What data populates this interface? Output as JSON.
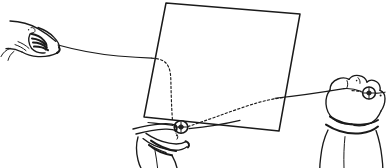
{
  "illustration": {
    "title": "Hand-sewing a button through fabric",
    "medium": "pen-and-ink line drawing",
    "background_color": "#ffffff",
    "ink_color": "#1a1a1a",
    "width": 391,
    "height": 168,
    "caption": "Line drawing: a left hand pulls a thread, the thread passes behind a square of fabric (shown dashed) down to a button held by a hand below, and continues to a second button held by a hand at the right."
  },
  "objects": {
    "fabric": {
      "name": "fabric square",
      "label": "fabric-square",
      "corners": {
        "top_left": [
          166,
          3
        ],
        "top_right": [
          300,
          14
        ],
        "bottom_right": [
          279,
          131
        ],
        "bottom_left": [
          144,
          117
        ]
      },
      "fill": "#ffffff",
      "stroke": "#1a1a1a"
    },
    "hands": [
      {
        "id": "left-hand",
        "label": "left hand pinching thread",
        "position": [
          8,
          18
        ],
        "grip": "pinch",
        "holds": "thread-end"
      },
      {
        "id": "bottom-hand",
        "label": "lower hand holding button",
        "position": [
          132,
          118
        ],
        "grip": "pinch",
        "holds": "button-lower"
      },
      {
        "id": "right-hand",
        "label": "right hand holding button",
        "position": [
          318,
          74
        ],
        "grip": "fist",
        "holds": "button-right",
        "has_cuff": true
      }
    ],
    "buttons": [
      {
        "id": "button-lower",
        "label": "button held below fabric",
        "center": [
          181,
          127
        ],
        "radius": 6.5,
        "hole_radius": 2.2
      },
      {
        "id": "button-right",
        "label": "button held at right",
        "center": [
          369,
          93
        ],
        "radius": 6.0,
        "hole_radius": 2.0
      }
    ],
    "threads": [
      {
        "id": "thread-left-visible",
        "label": "thread from left hand to fabric edge",
        "style": "solid",
        "meaning": "thread in front of / beside fabric"
      },
      {
        "id": "thread-behind-fabric-left",
        "label": "thread hidden behind fabric descending to button",
        "style": "dashed",
        "meaning": "thread concealed behind the fabric"
      },
      {
        "id": "thread-behind-fabric-right",
        "label": "thread hidden behind fabric rising to the right",
        "style": "dashed",
        "meaning": "thread concealed behind the fabric"
      },
      {
        "id": "thread-right-visible",
        "label": "thread from fabric edge to right hand button",
        "style": "solid",
        "meaning": "thread in front of / beside fabric"
      }
    ]
  },
  "legend": {
    "solid_line_means": "thread visible in front of the fabric",
    "dashed_line_means": "thread hidden behind the fabric"
  }
}
